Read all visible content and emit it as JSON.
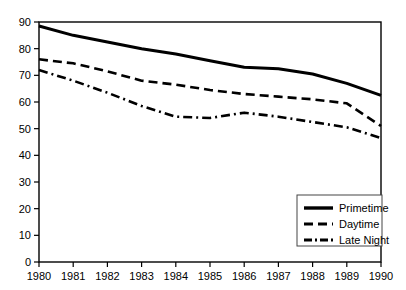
{
  "chart_data": {
    "type": "line",
    "title": "",
    "subtitle": "",
    "xlabel": "",
    "ylabel": "",
    "x": [
      1980,
      1981,
      1982,
      1983,
      1984,
      1985,
      1986,
      1987,
      1988,
      1989,
      1990
    ],
    "xtick_labels": [
      "1980",
      "1981",
      "1982",
      "1983",
      "1984",
      "1985",
      "1986",
      "1987",
      "1988",
      "1989",
      "1990"
    ],
    "ytick_labels": [
      "0",
      "10",
      "20",
      "30",
      "40",
      "50",
      "60",
      "70",
      "80",
      "90"
    ],
    "ytick_values": [
      0,
      10,
      20,
      30,
      40,
      50,
      60,
      70,
      80,
      90
    ],
    "xlim": [
      1980,
      1990
    ],
    "ylim": [
      0,
      90
    ],
    "grid": false,
    "legend_position": "bottom-right",
    "series": [
      {
        "name": "Primetime",
        "style": "solid",
        "color": "#000000",
        "values": [
          88.5,
          85.0,
          82.5,
          80.0,
          78.0,
          75.5,
          73.0,
          72.5,
          70.5,
          67.0,
          62.5
        ]
      },
      {
        "name": "Daytime",
        "style": "dashed",
        "color": "#000000",
        "values": [
          76.0,
          74.5,
          71.5,
          68.0,
          66.5,
          64.5,
          63.0,
          62.0,
          61.0,
          59.5,
          51.0
        ]
      },
      {
        "name": "Late Night",
        "style": "dash-dot",
        "color": "#000000",
        "values": [
          72.0,
          68.0,
          63.5,
          58.5,
          54.5,
          54.0,
          56.0,
          54.5,
          52.5,
          50.5,
          46.5
        ]
      }
    ]
  },
  "legend": {
    "items": [
      {
        "label": "Primetime",
        "style": "solid"
      },
      {
        "label": "Daytime",
        "style": "dashed"
      },
      {
        "label": "Late Night",
        "style": "dash-dot"
      }
    ]
  },
  "colors": {
    "line": "#000000",
    "frame": "#000000",
    "background": "#ffffff"
  }
}
